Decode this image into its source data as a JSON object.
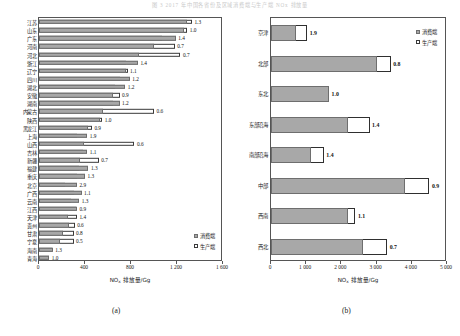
{
  "page": {
    "header_faint_text": "图 3  2017 年中国各省份及区域消费端与生产端 NOx 排放量"
  },
  "legend": {
    "consumption_label": "消费端",
    "production_label": "生产端",
    "consumption_color": "#a8a8a8",
    "production_color": "#ffffff"
  },
  "captions": {
    "a": "(a)",
    "b": "(b)"
  },
  "chart_data": [
    {
      "type": "bar",
      "id": "chart-a",
      "orientation": "horizontal",
      "title": "",
      "xlabel": "NOx 排放量/Gg",
      "xlabel_prefix": "NO",
      "xlabel_sub": "x",
      "xlabel_suffix": " 排放量/Gg",
      "ylabel": "",
      "xlim": [
        0,
        1600
      ],
      "xticks": [
        0,
        400,
        800,
        1200,
        1600
      ],
      "xticklabels": [
        "0",
        "400",
        "800",
        "1 200",
        "1 600"
      ],
      "grid": false,
      "legend_position": "bottom-right",
      "categories": [
        "江苏",
        "山东",
        "广东",
        "河南",
        "河北",
        "浙江",
        "辽宁",
        "四川",
        "湖北",
        "安徽",
        "湖南",
        "内蒙古",
        "陕西",
        "黑龙江",
        "上海",
        "山西",
        "吉林",
        "新疆",
        "福建",
        "重庆",
        "北京",
        "广西",
        "云南",
        "江西",
        "天津",
        "贵州",
        "甘肃",
        "宁夏",
        "海南",
        "青海"
      ],
      "series": [
        {
          "name": "消费端",
          "values": [
            1290,
            1260,
            1190,
            1000,
            870,
            860,
            760,
            790,
            750,
            640,
            700,
            560,
            530,
            430,
            420,
            390,
            420,
            360,
            430,
            400,
            330,
            370,
            350,
            330,
            250,
            260,
            210,
            180,
            120,
            90
          ]
        },
        {
          "name": "生产端",
          "values": [
            1330,
            1290,
            1070,
            1180,
            1230,
            760,
            770,
            700,
            660,
            700,
            640,
            1000,
            550,
            460,
            330,
            830,
            380,
            520,
            350,
            330,
            230,
            300,
            280,
            320,
            330,
            310,
            300,
            300,
            110,
            85
          ]
        }
      ],
      "data_labels": [
        "1.3",
        "1.0",
        "1.4",
        "0.7",
        "0.7",
        "1.4",
        "1.1",
        "1.2",
        "1.2",
        "0.9",
        "1.2",
        "0.6",
        "1.0",
        "0.9",
        "1.9",
        "0.6",
        "1.1",
        "0.7",
        "1.3",
        "1.3",
        "2.9",
        "1.1",
        "1.3",
        "0.9",
        "1.4",
        "0.6",
        "0.8",
        "0.5",
        "1.3",
        "1.0"
      ]
    },
    {
      "type": "bar",
      "id": "chart-b",
      "orientation": "horizontal",
      "title": "",
      "xlabel": "NOx 排放量/Gg",
      "xlabel_prefix": "NO",
      "xlabel_sub": "x",
      "xlabel_suffix": " 排放量/Gg",
      "ylabel": "",
      "xlim": [
        0,
        5000
      ],
      "xticks": [
        0,
        1000,
        2000,
        3000,
        4000,
        5000
      ],
      "xticklabels": [
        "0",
        "1 000",
        "2 000",
        "3 000",
        "4 000",
        "5 000"
      ],
      "grid": false,
      "legend_position": "top-right",
      "categories": [
        "京津",
        "北部",
        "东北",
        "东部沿海",
        "南部沿海",
        "中部",
        "西南",
        "西北"
      ],
      "series": [
        {
          "name": "消费端",
          "values": [
            700,
            3000,
            1650,
            2200,
            1150,
            3800,
            2200,
            2600
          ]
        },
        {
          "name": "生产端",
          "values": [
            1030,
            3400,
            1600,
            2800,
            1500,
            4500,
            2400,
            3300
          ]
        }
      ],
      "data_labels": [
        "1.9",
        "0.8",
        "1.0",
        "1.4",
        "1.4",
        "0.9",
        "1.1",
        "0.7"
      ]
    }
  ]
}
